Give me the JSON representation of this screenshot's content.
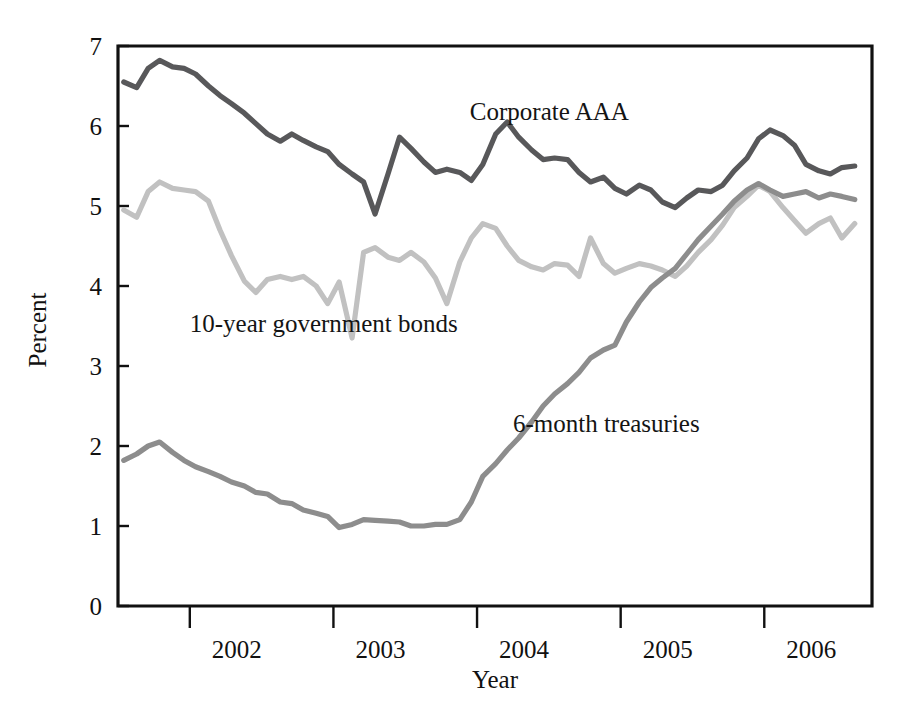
{
  "chart_data": {
    "type": "line",
    "title": "",
    "xlabel": "Year",
    "ylabel": "Percent",
    "ylim": [
      0,
      7
    ],
    "xlim": [
      2001.5,
      2006.75
    ],
    "grid": false,
    "legend_position": "inline-annotations",
    "y_ticks": [
      "0",
      "1",
      "2",
      "3",
      "4",
      "5",
      "6",
      "7"
    ],
    "y_tick_values": [
      0,
      1,
      2,
      3,
      4,
      5,
      6,
      7
    ],
    "x_ticks": [
      "2002",
      "2003",
      "2004",
      "2005",
      "2006"
    ],
    "x_tick_values": [
      2002,
      2003,
      2004,
      2005,
      2006
    ],
    "series": [
      {
        "name": "Corporate AAA",
        "color": "#58585a",
        "label_x": 2003.95,
        "label_y": 6.08,
        "x": [
          2001.54,
          2001.63,
          2001.71,
          2001.79,
          2001.88,
          2001.96,
          2002.04,
          2002.13,
          2002.21,
          2002.29,
          2002.38,
          2002.46,
          2002.54,
          2002.63,
          2002.71,
          2002.79,
          2002.88,
          2002.96,
          2003.04,
          2003.13,
          2003.21,
          2003.29,
          2003.38,
          2003.46,
          2003.54,
          2003.63,
          2003.71,
          2003.79,
          2003.88,
          2003.96,
          2004.04,
          2004.13,
          2004.21,
          2004.29,
          2004.38,
          2004.46,
          2004.54,
          2004.63,
          2004.71,
          2004.79,
          2004.88,
          2004.96,
          2005.04,
          2005.13,
          2005.21,
          2005.29,
          2005.38,
          2005.46,
          2005.54,
          2005.63,
          2005.71,
          2005.79,
          2005.88,
          2005.96,
          2006.04,
          2006.13,
          2006.21,
          2006.29,
          2006.38,
          2006.46,
          2006.54,
          2006.63
        ],
        "y": [
          6.55,
          6.48,
          6.72,
          6.82,
          6.74,
          6.72,
          6.65,
          6.5,
          6.38,
          6.28,
          6.16,
          6.03,
          5.9,
          5.81,
          5.9,
          5.82,
          5.74,
          5.68,
          5.52,
          5.4,
          5.3,
          4.9,
          5.4,
          5.86,
          5.72,
          5.55,
          5.42,
          5.46,
          5.42,
          5.32,
          5.52,
          5.9,
          6.05,
          5.86,
          5.7,
          5.58,
          5.6,
          5.58,
          5.42,
          5.3,
          5.36,
          5.22,
          5.15,
          5.26,
          5.2,
          5.05,
          4.98,
          5.1,
          5.2,
          5.18,
          5.26,
          5.44,
          5.6,
          5.84,
          5.95,
          5.88,
          5.76,
          5.52,
          5.44,
          5.4,
          5.48,
          5.5
        ],
        "endpoint_values": {
          "start": 6.55,
          "peak": 6.82,
          "min": 4.9,
          "end": 5.5
        }
      },
      {
        "name": "10-year government bonds",
        "color": "#c1c1c1",
        "label_x": 2002.0,
        "label_y": 3.42,
        "x": [
          2001.54,
          2001.63,
          2001.71,
          2001.79,
          2001.88,
          2001.96,
          2002.04,
          2002.13,
          2002.21,
          2002.29,
          2002.38,
          2002.46,
          2002.54,
          2002.63,
          2002.71,
          2002.79,
          2002.88,
          2002.96,
          2003.04,
          2003.13,
          2003.21,
          2003.29,
          2003.38,
          2003.46,
          2003.54,
          2003.63,
          2003.71,
          2003.79,
          2003.88,
          2003.96,
          2004.04,
          2004.13,
          2004.21,
          2004.29,
          2004.38,
          2004.46,
          2004.54,
          2004.63,
          2004.71,
          2004.79,
          2004.88,
          2004.96,
          2005.04,
          2005.13,
          2005.21,
          2005.29,
          2005.38,
          2005.46,
          2005.54,
          2005.63,
          2005.71,
          2005.79,
          2005.88,
          2005.96,
          2006.04,
          2006.13,
          2006.21,
          2006.29,
          2006.38,
          2006.46,
          2006.54,
          2006.63
        ],
        "y": [
          4.95,
          4.86,
          5.18,
          5.3,
          5.22,
          5.2,
          5.18,
          5.06,
          4.7,
          4.38,
          4.06,
          3.92,
          4.08,
          4.12,
          4.08,
          4.12,
          4.0,
          3.78,
          4.05,
          3.35,
          4.42,
          4.48,
          4.36,
          4.32,
          4.42,
          4.3,
          4.1,
          3.78,
          4.3,
          4.6,
          4.78,
          4.72,
          4.5,
          4.32,
          4.24,
          4.2,
          4.28,
          4.26,
          4.12,
          4.6,
          4.28,
          4.16,
          4.22,
          4.28,
          4.25,
          4.2,
          4.12,
          4.25,
          4.42,
          4.58,
          4.76,
          4.98,
          5.12,
          5.26,
          5.18,
          4.98,
          4.82,
          4.66,
          4.78,
          4.85,
          4.6,
          4.78
        ],
        "endpoint_values": {
          "start": 4.95,
          "peak": 5.3,
          "min": 3.35,
          "end": 4.78
        }
      },
      {
        "name": "6-month treasuries",
        "color": "#8d8d8d",
        "label_x": 2004.25,
        "label_y": 2.18,
        "x": [
          2001.54,
          2001.63,
          2001.71,
          2001.79,
          2001.88,
          2001.96,
          2002.04,
          2002.13,
          2002.21,
          2002.29,
          2002.38,
          2002.46,
          2002.54,
          2002.63,
          2002.71,
          2002.79,
          2002.88,
          2002.96,
          2003.04,
          2003.13,
          2003.21,
          2003.29,
          2003.38,
          2003.46,
          2003.54,
          2003.63,
          2003.71,
          2003.79,
          2003.88,
          2003.96,
          2004.04,
          2004.13,
          2004.21,
          2004.29,
          2004.38,
          2004.46,
          2004.54,
          2004.63,
          2004.71,
          2004.79,
          2004.88,
          2004.96,
          2005.04,
          2005.13,
          2005.21,
          2005.29,
          2005.38,
          2005.46,
          2005.54,
          2005.63,
          2005.71,
          2005.79,
          2005.88,
          2005.96,
          2006.04,
          2006.13,
          2006.21,
          2006.29,
          2006.38,
          2006.46,
          2006.54,
          2006.63
        ],
        "y": [
          1.82,
          1.9,
          2.0,
          2.05,
          1.92,
          1.82,
          1.74,
          1.68,
          1.62,
          1.55,
          1.5,
          1.42,
          1.4,
          1.3,
          1.28,
          1.2,
          1.16,
          1.12,
          0.98,
          1.02,
          1.08,
          1.07,
          1.06,
          1.05,
          1.0,
          1.0,
          1.02,
          1.02,
          1.08,
          1.3,
          1.62,
          1.78,
          1.95,
          2.1,
          2.3,
          2.5,
          2.65,
          2.78,
          2.92,
          3.1,
          3.2,
          3.26,
          3.55,
          3.8,
          3.98,
          4.1,
          4.22,
          4.4,
          4.58,
          4.75,
          4.9,
          5.06,
          5.2,
          5.28,
          5.2,
          5.12,
          5.15,
          5.18,
          5.1,
          5.15,
          5.12,
          5.08
        ],
        "endpoint_values": {
          "start": 1.82,
          "peak": 5.28,
          "min": 0.98,
          "end": 5.08
        }
      }
    ]
  },
  "axes": {
    "y_title": "Percent",
    "x_title": "Year"
  }
}
